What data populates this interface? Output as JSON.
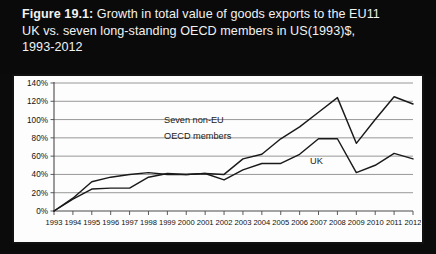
{
  "title": {
    "figure_number": "Figure 19.1:",
    "line1_rest": " Growth in total value of goods exports to the EU11",
    "line2": "UK vs. seven long-standing OECD members in US(1993)$,",
    "line3": "1993-2012"
  },
  "annotations": {
    "series_b_line1": "Seven non-EU",
    "series_b_line2": "OECD members",
    "series_a": "UK"
  },
  "chart_data": {
    "type": "line",
    "title": "Growth in total value of goods exports to the EU11 UK vs. seven long-standing OECD members in US(1993)$, 1993-2012",
    "xlabel": "",
    "ylabel": "",
    "ylim": [
      0,
      140
    ],
    "ytick_labels": [
      "0%",
      "20%",
      "40%",
      "60%",
      "80%",
      "100%",
      "120%",
      "140%"
    ],
    "ytick_values": [
      0,
      20,
      40,
      60,
      80,
      100,
      120,
      140
    ],
    "grid": true,
    "legend_position": "inline-annotation",
    "x": [
      1993,
      1994,
      1995,
      1996,
      1997,
      1998,
      1999,
      2000,
      2001,
      2002,
      2003,
      2004,
      2005,
      2006,
      2007,
      2008,
      2009,
      2010,
      2011,
      2012
    ],
    "xtick_labels": [
      "1993",
      "1994",
      "1995",
      "1996",
      "1997",
      "1998",
      "1999",
      "2000",
      "2001",
      "2002",
      "2003",
      "2004",
      "2005",
      "2006",
      "2007",
      "2008",
      "2009",
      "2010",
      "2011",
      "2012"
    ],
    "series": [
      {
        "name": "UK",
        "values": [
          0,
          13,
          24,
          25,
          25,
          37,
          41,
          40,
          41,
          34,
          45,
          52,
          52,
          62,
          79,
          79,
          42,
          50,
          63,
          57
        ]
      },
      {
        "name": "Seven non-EU OECD members",
        "values": [
          0,
          14,
          32,
          37,
          40,
          42,
          40,
          40,
          41,
          40,
          57,
          62,
          79,
          92,
          108,
          124,
          74,
          100,
          125,
          117
        ]
      }
    ]
  },
  "colors": {
    "header_background": "#0a0a0a",
    "header_text": "#f2f2f2",
    "panel_background": "#fdfdfd",
    "panel_border": "#111111",
    "gridline": "#8c8c8c",
    "series_line": "#1a1a1a"
  }
}
